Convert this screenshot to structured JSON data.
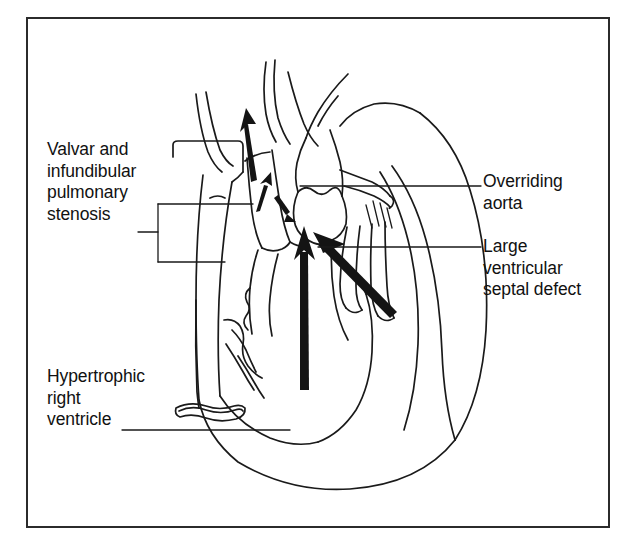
{
  "figure": {
    "kind": "anatomical-line-diagram",
    "background_color": "#ffffff",
    "frame": {
      "border_color": "#2b2b2b",
      "border_width_px": 2,
      "x": 26,
      "y": 17,
      "width": 584,
      "height": 511
    },
    "line_color": "#1a1a1a",
    "arrow_color": "#141414"
  },
  "labels": [
    {
      "id": "pulmonary-stenosis",
      "text": "Valvar and\ninfundibular\npulmonary\nstenosis",
      "lines": [
        "Valvar and",
        "infundibular",
        "pulmonary",
        "stenosis"
      ],
      "position": "left-upper",
      "leader": "bracket-two-prong"
    },
    {
      "id": "overriding-aorta",
      "text": "Overriding\naorta",
      "lines": [
        "Overriding",
        "aorta"
      ],
      "position": "right-upper",
      "leader": "straight-horizontal"
    },
    {
      "id": "ventricular-septal-defect",
      "text": "Large\nventricular\nseptal defect",
      "lines": [
        "Large",
        "ventricular",
        "septal defect"
      ],
      "position": "right-middle",
      "leader": "straight-horizontal"
    },
    {
      "id": "hypertrophic-right-ventricle",
      "text": "Hypertrophic\nright\nventricle",
      "lines": [
        "Hypertrophic",
        "right",
        "ventricle"
      ],
      "position": "left-lower",
      "leader": "straight-horizontal"
    }
  ],
  "flow_arrows": [
    {
      "id": "pulmonary-outflow-arrow",
      "description": "upward arrow in pulmonary artery",
      "direction": "up"
    },
    {
      "id": "infundibulum-arrow",
      "description": "small upward arrow through narrowed infundibulum",
      "direction": "up"
    },
    {
      "id": "stenosis-short-arrow",
      "description": "short arrow at valvar stenosis",
      "direction": "down-right"
    },
    {
      "id": "right-ventricle-shunt-arrow",
      "description": "thick vertical arrow from right ventricle to aorta",
      "direction": "up"
    },
    {
      "id": "left-ventricle-shunt-arrow",
      "description": "thick diagonal arrow from left ventricle across septal defect",
      "direction": "up-left"
    }
  ]
}
